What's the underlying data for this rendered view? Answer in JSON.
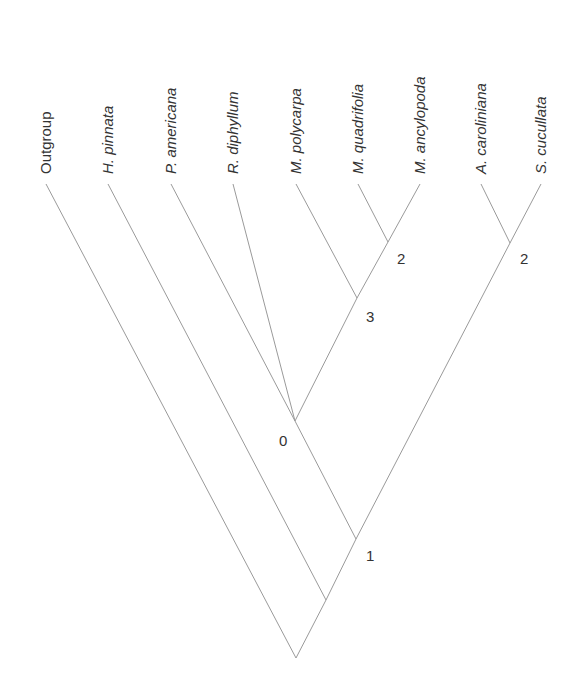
{
  "diagram": {
    "type": "cladogram",
    "line_color": "#9a9a9a",
    "text_color": "#333333",
    "taxa": [
      {
        "name": "Outgroup",
        "italic": false,
        "x": 46,
        "y": 182
      },
      {
        "name": "H. pinnata",
        "italic": true,
        "x": 108,
        "y": 182
      },
      {
        "name": "P. americana",
        "italic": true,
        "x": 171,
        "y": 182
      },
      {
        "name": "R. diphyllum",
        "italic": true,
        "x": 233,
        "y": 182
      },
      {
        "name": "M. polycarpa",
        "italic": true,
        "x": 296,
        "y": 182
      },
      {
        "name": "M. quadrifolia",
        "italic": true,
        "x": 358,
        "y": 182
      },
      {
        "name": "M. ancylopoda",
        "italic": true,
        "x": 420,
        "y": 182
      },
      {
        "name": "A. caroliniana",
        "italic": true,
        "x": 481,
        "y": 182
      },
      {
        "name": "S. cucullata",
        "italic": true,
        "x": 541,
        "y": 182
      }
    ],
    "nodes": [
      {
        "id": "root",
        "x": 296,
        "y": 658,
        "label": ""
      },
      {
        "id": "n_hp",
        "x": 326,
        "y": 600,
        "label": ""
      },
      {
        "id": "n1",
        "x": 356,
        "y": 539,
        "label": "1",
        "lx": 366,
        "ly": 561
      },
      {
        "id": "n0",
        "x": 295,
        "y": 421,
        "label": "0",
        "lx": 279,
        "ly": 446
      },
      {
        "id": "n3",
        "x": 357,
        "y": 298,
        "label": "3",
        "lx": 366,
        "ly": 322
      },
      {
        "id": "n2a",
        "x": 388,
        "y": 242,
        "label": "2",
        "lx": 397,
        "ly": 264
      },
      {
        "id": "n2b",
        "x": 510,
        "y": 243,
        "label": "2",
        "lx": 520,
        "ly": 264
      }
    ],
    "edges": [
      {
        "from": "root",
        "to": "Outgroup"
      },
      {
        "from": "root",
        "to": "n_hp"
      },
      {
        "from": "n_hp",
        "to": "H. pinnata"
      },
      {
        "from": "n_hp",
        "to": "n1"
      },
      {
        "from": "n1",
        "to": "n0"
      },
      {
        "from": "n1",
        "to": "n2b"
      },
      {
        "from": "n0",
        "to": "P. americana"
      },
      {
        "from": "n0",
        "to": "R. diphyllum"
      },
      {
        "from": "n0",
        "to": "n3"
      },
      {
        "from": "n3",
        "to": "M. polycarpa"
      },
      {
        "from": "n3",
        "to": "n2a"
      },
      {
        "from": "n2a",
        "to": "M. quadrifolia"
      },
      {
        "from": "n2a",
        "to": "M. ancylopoda"
      },
      {
        "from": "n2b",
        "to": "A. caroliniana"
      },
      {
        "from": "n2b",
        "to": "S. cucullata"
      }
    ]
  }
}
